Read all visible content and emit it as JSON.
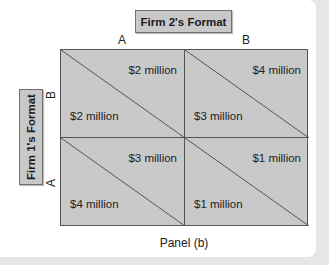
{
  "figure": {
    "caption": "Panel (b)",
    "column_player": {
      "label": "Firm 2's Format",
      "strategies": [
        "A",
        "B"
      ]
    },
    "row_player": {
      "label": "Firm 1's Format",
      "strategies": [
        "B",
        "A"
      ]
    },
    "payoff_matrix": {
      "note": "Upper-right value = Firm 2 payoff; lower-left value = Firm 1 payoff",
      "rows": [
        {
          "row_strategy": "B",
          "cells": [
            {
              "col_strategy": "A",
              "upper_right": "$2 million",
              "lower_left": "$2 million"
            },
            {
              "col_strategy": "B",
              "upper_right": "$4 million",
              "lower_left": "$3 million"
            }
          ]
        },
        {
          "row_strategy": "A",
          "cells": [
            {
              "col_strategy": "A",
              "upper_right": "$3 million",
              "lower_left": "$4 million"
            },
            {
              "col_strategy": "B",
              "upper_right": "$1 million",
              "lower_left": "$1 million"
            }
          ]
        }
      ]
    },
    "colors": {
      "cell_fill": "#c9c9c9",
      "label_box_fill": "#c8c8c8",
      "grid_line": "#555555",
      "background": "#ffffff",
      "outer_background": "#e6e6e6"
    }
  }
}
